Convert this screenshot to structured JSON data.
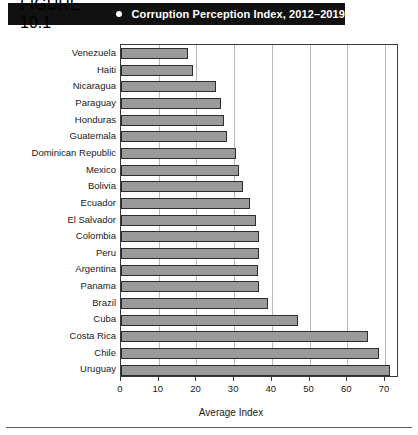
{
  "header": {
    "figure_number": "FIGURE 10.1",
    "bullet_icon": "bullet-dot-icon",
    "title": "Corruption Perception Index, 2012–2019",
    "background_color": "#111111",
    "text_color": "#ffffff"
  },
  "chart_data": {
    "type": "bar",
    "orientation": "horizontal",
    "title": "Corruption Perception Index, 2012–2019",
    "xlabel": "Average Index",
    "ylabel": "",
    "xlim": [
      0,
      73.7
    ],
    "xticks": [
      0,
      10,
      20,
      30,
      40,
      50,
      60,
      70
    ],
    "xtick_labels": [
      "0",
      "10",
      "20",
      "30",
      "40",
      "50",
      "60",
      "70"
    ],
    "grid": "vertical",
    "legend": "none",
    "bar_color": "#9a9a9a",
    "bar_edge_color": "#2d2d2d",
    "categories": [
      "Venezuela",
      "Haiti",
      "Nicaragua",
      "Paraguay",
      "Honduras",
      "Guatemala",
      "Dominican Republic",
      "Mexico",
      "Bolivia",
      "Ecuador",
      "El Salvador",
      "Colombia",
      "Peru",
      "Argentina",
      "Panama",
      "Brazil",
      "Cuba",
      "Costa Rica",
      "Chile",
      "Uruguay"
    ],
    "values": [
      17.8,
      19.1,
      25.1,
      26.6,
      27.3,
      28.0,
      30.4,
      31.3,
      32.4,
      34.2,
      35.9,
      36.5,
      36.5,
      36.2,
      36.5,
      39.1,
      46.8,
      65.4,
      68.3,
      71.3
    ]
  }
}
